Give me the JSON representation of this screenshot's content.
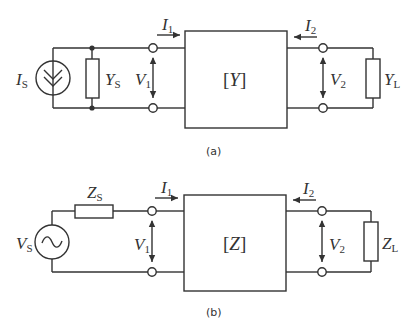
{
  "diagram": {
    "panel_a": {
      "caption": "(a)",
      "source": {
        "symbol": "I",
        "subscript": "S",
        "type": "current-source"
      },
      "source_admittance": {
        "symbol": "Y",
        "subscript": "S"
      },
      "network": {
        "open": "[",
        "symbol": "Y",
        "close": "]"
      },
      "load": {
        "symbol": "Y",
        "subscript": "L"
      },
      "port1": {
        "current": {
          "symbol": "I",
          "subscript": "1"
        },
        "voltage": {
          "symbol": "V",
          "subscript": "1"
        }
      },
      "port2": {
        "current": {
          "symbol": "I",
          "subscript": "2"
        },
        "voltage": {
          "symbol": "V",
          "subscript": "2"
        }
      }
    },
    "panel_b": {
      "caption": "(b)",
      "source": {
        "symbol": "V",
        "subscript": "S",
        "type": "ac-voltage-source"
      },
      "source_impedance": {
        "symbol": "Z",
        "subscript": "S"
      },
      "network": {
        "open": "[",
        "symbol": "Z",
        "close": "]"
      },
      "load": {
        "symbol": "Z",
        "subscript": "L"
      },
      "port1": {
        "current": {
          "symbol": "I",
          "subscript": "1"
        },
        "voltage": {
          "symbol": "V",
          "subscript": "1"
        }
      },
      "port2": {
        "current": {
          "symbol": "I",
          "subscript": "2"
        },
        "voltage": {
          "symbol": "V",
          "subscript": "2"
        }
      }
    }
  }
}
